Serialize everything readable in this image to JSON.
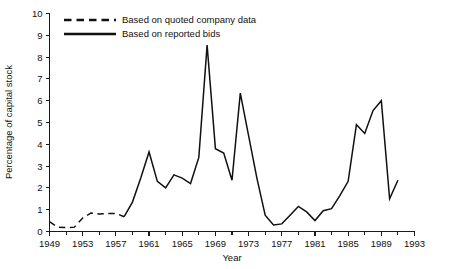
{
  "chart_data": {
    "type": "line",
    "title": "",
    "xlabel": "Year",
    "ylabel": "Percentage of capital stock",
    "xlim": [
      1949,
      1993
    ],
    "ylim": [
      0,
      10
    ],
    "grid": false,
    "legend_position": "top-left",
    "x_ticks": [
      1949,
      1953,
      1957,
      1961,
      1965,
      1969,
      1973,
      1977,
      1981,
      1985,
      1989,
      1993
    ],
    "x_minor_ticks": [
      1951,
      1955,
      1959,
      1963,
      1967,
      1971,
      1975,
      1979,
      1983,
      1987,
      1991
    ],
    "y_ticks": [
      0,
      1,
      2,
      3,
      4,
      5,
      6,
      7,
      8,
      9,
      10
    ],
    "series": [
      {
        "name": "Based on quoted company data",
        "style": "dashed",
        "color": "#111111",
        "x": [
          1949,
          1950,
          1951,
          1952,
          1953,
          1954,
          1955,
          1956,
          1957,
          1958
        ],
        "values": [
          0.45,
          0.2,
          0.18,
          0.2,
          0.62,
          0.85,
          0.8,
          0.82,
          0.83,
          0.68
        ]
      },
      {
        "name": "Based on reported bids",
        "style": "solid",
        "color": "#111111",
        "x": [
          1958,
          1959,
          1960,
          1961,
          1962,
          1963,
          1964,
          1965,
          1966,
          1967,
          1968,
          1969,
          1970,
          1971,
          1972,
          1973,
          1974,
          1975,
          1976,
          1977,
          1978,
          1979,
          1980,
          1981,
          1982,
          1983,
          1984,
          1985,
          1986,
          1987,
          1988,
          1989,
          1990,
          1991
        ],
        "values": [
          0.68,
          1.35,
          2.45,
          3.65,
          2.3,
          2.0,
          2.6,
          2.45,
          2.2,
          3.4,
          8.55,
          3.8,
          3.6,
          2.35,
          6.35,
          4.4,
          2.45,
          0.75,
          0.3,
          0.35,
          0.75,
          1.15,
          0.9,
          0.5,
          0.95,
          1.05,
          1.65,
          2.3,
          4.9,
          4.5,
          5.55,
          6.0,
          1.5,
          2.35
        ]
      }
    ]
  },
  "legend": {
    "items": [
      {
        "label": "Based on quoted company data",
        "style": "dashed"
      },
      {
        "label": "Based on reported bids",
        "style": "solid"
      }
    ]
  },
  "axes": {
    "x_title": "Year",
    "y_title": "Percentage of capital stock"
  }
}
